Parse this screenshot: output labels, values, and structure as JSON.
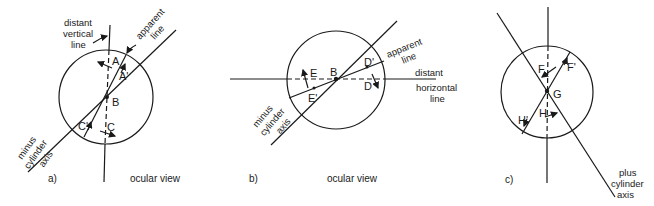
{
  "figure": {
    "panels": [
      {
        "id": "a",
        "caption": "a)",
        "view_label": "ocular view",
        "line_labels": {
          "vertical_1": "distant",
          "vertical_2": "vertical",
          "vertical_3": "line",
          "apparent_1": "apparent",
          "apparent_2": "line",
          "axis_1": "minus",
          "axis_2": "cylinder",
          "axis_3": "axis"
        },
        "points": {
          "A": "A",
          "A_prime": "A'",
          "B": "B",
          "C": "C",
          "C_prime": "C'"
        }
      },
      {
        "id": "b",
        "caption": "b)",
        "view_label": "ocular view",
        "line_labels": {
          "horizontal_1": "distant",
          "horizontal_2": "horizontal",
          "horizontal_3": "line",
          "apparent_1": "apparent",
          "apparent_2": "line",
          "axis_1": "minus",
          "axis_2": "cylinder",
          "axis_3": "axis"
        },
        "points": {
          "B": "B",
          "D": "D",
          "D_prime": "D'",
          "E": "E",
          "E_prime": "E'"
        }
      },
      {
        "id": "c",
        "caption": "c)",
        "line_labels": {
          "axis_1": "plus",
          "axis_2": "cylinder",
          "axis_3": "axis"
        },
        "points": {
          "F": "F",
          "F_prime": "F'",
          "G": "G",
          "H": "H",
          "H_prime": "H'"
        }
      }
    ]
  }
}
